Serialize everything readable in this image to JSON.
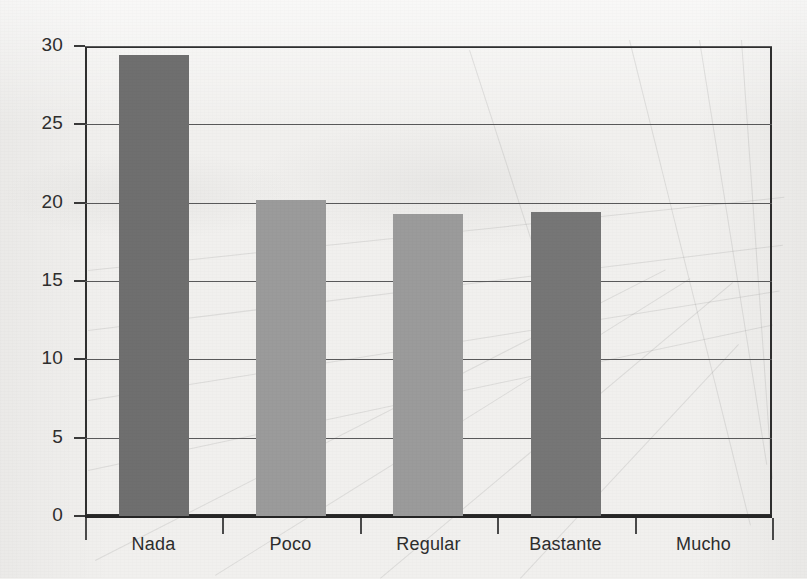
{
  "chart_data": {
    "type": "bar",
    "title": "",
    "subtitle": "",
    "xlabel": "",
    "ylabel": "",
    "categories": [
      "Nada",
      "Poco",
      "Regular",
      "Bastante",
      "Mucho"
    ],
    "values": [
      29.4,
      20.2,
      19.3,
      19.4,
      0
    ],
    "bar_colors": [
      "#6f6f6f",
      "#9b9b9b",
      "#9b9b9b",
      "#767676",
      "#9b9b9b"
    ],
    "ylim": [
      0,
      30
    ],
    "yticks": [
      0,
      5,
      10,
      15,
      20,
      25,
      30
    ],
    "ytick_labels": [
      "0",
      "5",
      "10",
      "15",
      "20",
      "25",
      "30"
    ],
    "grid": true,
    "grid_axis": "y",
    "legend": false,
    "legend_position": "none",
    "annotations": []
  },
  "style": {
    "background": "#f1f0ee",
    "axis_color": "#2f2f2f",
    "grid_color": "#59595a",
    "tick_label_color": "#2e2e2e"
  }
}
